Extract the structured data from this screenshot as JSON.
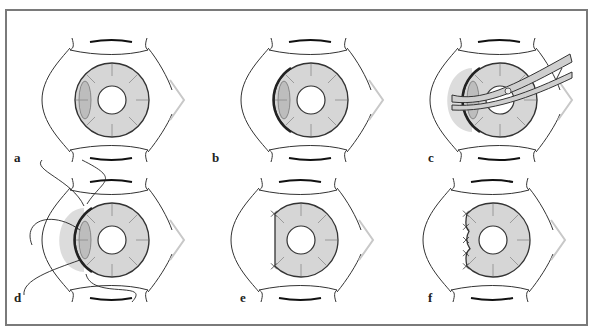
{
  "figure": {
    "colors": {
      "outline": "#333333",
      "iris_fill": "#d6d6d6",
      "spoke": "#8a8a8a",
      "caruncle": "#c8c8c8",
      "frame": "#7a7a7a",
      "instrument": "#cfcfcf",
      "shadow": "#dcdcdc"
    },
    "panels": [
      {
        "label": "a",
        "step": "intact"
      },
      {
        "label": "b",
        "step": "detached-edge"
      },
      {
        "label": "c",
        "step": "instrument"
      },
      {
        "label": "d",
        "step": "sutures-placed"
      },
      {
        "label": "e",
        "step": "trimmed-straight-edge"
      },
      {
        "label": "f",
        "step": "sutured-edge"
      }
    ]
  }
}
